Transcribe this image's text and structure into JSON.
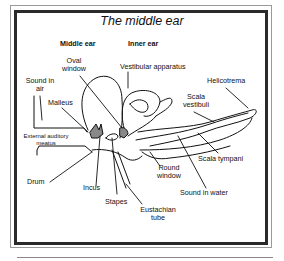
{
  "title": "The middle ear",
  "section_headers": {
    "middle_ear": "Middle ear",
    "inner_ear": "Inner ear"
  },
  "labels": {
    "oval_window": [
      "Oval",
      "window"
    ],
    "vestibular_apparatus": "Vestibular apparatus",
    "helicotrema": "Helicotrema",
    "sound_in_air": [
      "Sound in",
      "air"
    ],
    "malleus": "Malleus",
    "scala_vestibuli": [
      "Scala",
      "vestibuli"
    ],
    "external_auditory_meatus": [
      "External auditory",
      "meatus"
    ],
    "scala_tympani": "Scala tympani",
    "round_window": [
      "Round",
      "window"
    ],
    "drum": "Drum",
    "incus": "Incus",
    "sound_in_water": "Sound in water",
    "stapes": "Stapes",
    "eustachian_tube": [
      "Eustachian",
      "tube"
    ]
  }
}
